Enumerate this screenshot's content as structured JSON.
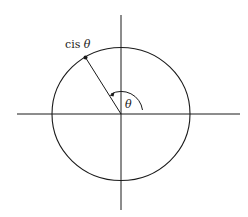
{
  "diagram": {
    "type": "unit-circle",
    "point_label_prefix": "cis ",
    "point_label_symbol": "θ",
    "angle_label": "θ",
    "colors": {
      "stroke": "#1a1a1a",
      "background": "#ffffff"
    }
  }
}
